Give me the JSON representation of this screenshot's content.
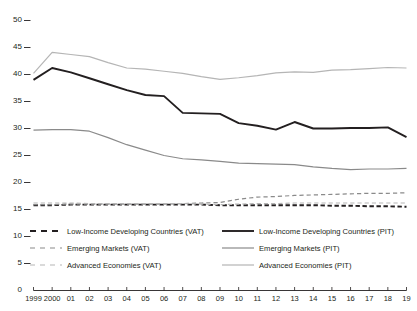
{
  "chart_data": {
    "type": "line",
    "title": "",
    "subtitle": "",
    "xlabel": "",
    "ylabel": "",
    "xlim": [
      1999,
      2019
    ],
    "ylim": [
      0,
      50
    ],
    "ytick_step": 5,
    "grid": false,
    "legend_position": "bottom",
    "x": [
      1999,
      2000,
      2001,
      2002,
      2003,
      2004,
      2005,
      2006,
      2007,
      2008,
      2009,
      2010,
      2011,
      2012,
      2013,
      2014,
      2015,
      2016,
      2017,
      2018,
      2019
    ],
    "xtick_labels": [
      "1999",
      "2000",
      "01",
      "02",
      "03",
      "04",
      "05",
      "06",
      "07",
      "08",
      "09",
      "10",
      "11",
      "12",
      "13",
      "14",
      "15",
      "16",
      "17",
      "18",
      "19"
    ],
    "ytick_labels": [
      "0",
      "5",
      "10",
      "15",
      "20",
      "25",
      "30",
      "35",
      "40",
      "45",
      "50"
    ],
    "series": [
      {
        "name": "Low-Income Developing Countries (PIT)",
        "style": "solid",
        "color": "#231f20",
        "width": 1.9,
        "values": [
          39.0,
          41.2,
          40.4,
          39.3,
          38.2,
          37.1,
          36.2,
          36.0,
          32.9,
          32.8,
          32.7,
          31.0,
          30.5,
          29.8,
          31.2,
          30.0,
          30.0,
          30.1,
          30.1,
          30.2,
          28.4
        ]
      },
      {
        "name": "Emerging Markets (PIT)",
        "style": "solid",
        "color": "#8a8a8a",
        "width": 1.2,
        "values": [
          29.7,
          29.8,
          29.8,
          29.5,
          28.3,
          27.0,
          26.0,
          25.0,
          24.4,
          24.2,
          23.9,
          23.6,
          23.5,
          23.4,
          23.3,
          22.9,
          22.6,
          22.4,
          22.5,
          22.5,
          22.6
        ]
      },
      {
        "name": "Advanced Economies (PIT)",
        "style": "solid",
        "color": "#b5b5b5",
        "width": 1.2,
        "values": [
          40.2,
          44.1,
          43.7,
          43.3,
          42.2,
          41.2,
          41.0,
          40.6,
          40.2,
          39.6,
          39.1,
          39.4,
          39.8,
          40.3,
          40.5,
          40.4,
          40.8,
          40.9,
          41.1,
          41.3,
          41.2
        ]
      },
      {
        "name": "Low-Income Developing Countries (VAT)",
        "style": "dashed",
        "color": "#231f20",
        "width": 1.9,
        "values": [
          15.8,
          15.8,
          15.9,
          15.9,
          15.9,
          15.9,
          15.9,
          15.9,
          15.9,
          15.9,
          15.8,
          15.8,
          15.8,
          15.8,
          15.8,
          15.8,
          15.7,
          15.7,
          15.6,
          15.6,
          15.5
        ]
      },
      {
        "name": "Emerging Markets (VAT)",
        "style": "dashed",
        "color": "#8a8a8a",
        "width": 1.2,
        "values": [
          15.9,
          15.9,
          16.0,
          16.0,
          16.0,
          16.0,
          16.0,
          16.0,
          16.1,
          16.2,
          16.3,
          16.9,
          17.3,
          17.4,
          17.6,
          17.7,
          17.8,
          17.9,
          18.0,
          18.0,
          18.1
        ]
      },
      {
        "name": "Advanced Economies (VAT)",
        "style": "dashed",
        "color": "#b5b5b5",
        "width": 1.2,
        "values": [
          16.2,
          16.2,
          16.2,
          16.1,
          16.1,
          16.1,
          16.1,
          16.1,
          16.1,
          16.0,
          15.9,
          16.0,
          16.1,
          16.1,
          16.2,
          16.2,
          16.2,
          16.2,
          16.2,
          16.2,
          16.2
        ]
      }
    ],
    "legend": [
      {
        "label": "Low-Income Developing Countries (VAT)",
        "style": "dashed",
        "color": "#231f20",
        "column": "left",
        "row": 0
      },
      {
        "label": "Emerging Markets (VAT)",
        "style": "dashed",
        "color": "#8a8a8a",
        "column": "left",
        "row": 1
      },
      {
        "label": "Advanced Economies (VAT)",
        "style": "dashed",
        "color": "#b5b5b5",
        "column": "left",
        "row": 2
      },
      {
        "label": "Low-Income Developing Countries (PIT)",
        "style": "solid",
        "color": "#231f20",
        "column": "right",
        "row": 0
      },
      {
        "label": "Emerging Markets (PIT)",
        "style": "solid",
        "color": "#8a8a8a",
        "column": "right",
        "row": 1
      },
      {
        "label": "Advanced Economies (PIT)",
        "style": "solid",
        "color": "#b5b5b5",
        "column": "right",
        "row": 2
      }
    ]
  },
  "colors": {
    "axis": "#231f20",
    "text": "#231f20",
    "background": "#ffffff",
    "series_dark": "#231f20",
    "series_mid": "#8a8a8a",
    "series_light": "#b5b5b5"
  }
}
